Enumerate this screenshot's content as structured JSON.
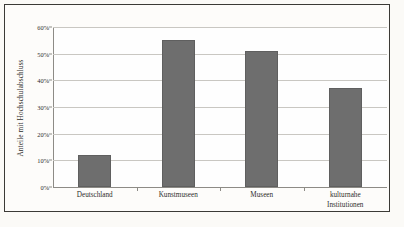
{
  "chart_data": {
    "type": "bar",
    "title": "",
    "subtitle": "",
    "xlabel": "",
    "ylabel": "Anteile mit Hochschulabschluss",
    "categories": [
      "Deutschland",
      "Kunstmuseen",
      "Museen",
      "kulturnahe Institutionen"
    ],
    "category_lines": [
      [
        "Deutschland"
      ],
      [
        "Kunstmuseen"
      ],
      [
        "Museen"
      ],
      [
        "kulturnahe",
        "Institutionen"
      ]
    ],
    "values": [
      12,
      55,
      51,
      37
    ],
    "ylim": [
      0,
      60
    ],
    "ytick_values": [
      0,
      10,
      20,
      30,
      40,
      50,
      60
    ],
    "ytick_labels": [
      "0%",
      "10%",
      "20%",
      "30%",
      "40%",
      "50%",
      "60%"
    ],
    "grid": true,
    "legend": false,
    "legend_position": "none",
    "bar_color": "#6e6e6e",
    "gridline_color": "#c9c7c2",
    "axis_color": "#8d8b86",
    "plot_background": "#fefefe",
    "figure_background": "#fbfaf7",
    "frame_color": "#3b3a36",
    "text_color": "#2e2d2a"
  }
}
